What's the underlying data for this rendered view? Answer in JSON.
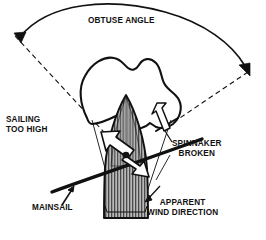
{
  "diagram": {
    "title": "OBTUSE ANGLE",
    "background_color": "#ffffff",
    "ink_color": "#111111",
    "hull_fill_color": "#8c8c8c",
    "sail_fill_color": "#ffffff",
    "labels": {
      "obtuse_angle": "OBTUSE ANGLE",
      "sailing_too_high_line1": "SAILING",
      "sailing_too_high_line2": "TOO HIGH",
      "spinnaker_broken_line1": "SPINNAKER",
      "spinnaker_broken_line2": "BROKEN",
      "apparent_wind_line1": "APPARENT",
      "apparent_wind_line2": "WIND DIRECTION",
      "mainsail": "MAINSAIL"
    },
    "icons": {
      "angle_arc_arrow": "double-headed-curved-arrow-icon",
      "left_dashed_ray": "dashed-ray-icon",
      "right_dashed_ray": "dashed-ray-icon",
      "wind_arrow_upleft": "white-arrow-up-left-icon",
      "wind_arrow_downright": "white-arrow-down-right-icon",
      "pole_arrow": "white-arrow-up-left-icon",
      "mainsail_pointer": "leader-arrow-icon",
      "apparent_wind_pointer": "leader-arrow-icon"
    }
  }
}
